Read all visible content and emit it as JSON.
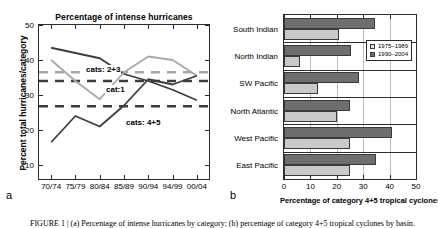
{
  "figure": {
    "panel_a_letter": "a",
    "panel_b_letter": "b",
    "caption": "FIGURE 1 | (a) Percentage of intense hurricanes by category; (b) percentage of category 4+5 tropical cyclones by basin."
  },
  "panel_a": {
    "title": "Percentage of intense hurricanes",
    "ylabel": "Percent total hurricanes/category",
    "letter": "a",
    "series_labels": {
      "cat1": "cat:1",
      "cat23": "cats: 2+3",
      "cat45": "cats: 4+5"
    }
  },
  "panel_b": {
    "xlabel": "Percentage of category 4+5 tropical cyclones",
    "letter": "b",
    "legend": [
      {
        "label": "1975–1989",
        "swatch": "old"
      },
      {
        "label": "1990–2004",
        "swatch": "new"
      }
    ]
  },
  "chart_data": [
    {
      "type": "line",
      "panel": "a",
      "title": "Percentage of intense hurricanes",
      "xlabel": "",
      "ylabel": "Percent total hurricanes/category",
      "categories": [
        "70/74",
        "75/79",
        "80/84",
        "85/89",
        "90/94",
        "94/99",
        "00/04"
      ],
      "xticklabels": [
        "70/74",
        "75/79",
        "80/84",
        "85/89",
        "90/94",
        "94/99",
        "00/04"
      ],
      "yticklabels": [
        "10",
        "20",
        "30",
        "40",
        "50"
      ],
      "yticks": [
        10,
        20,
        30,
        40,
        50
      ],
      "ylim": [
        6,
        50
      ],
      "grid": false,
      "legend_position": "inline-annotations",
      "series": [
        {
          "name": "cat:1",
          "label": "cat:1",
          "color": "#3d3d3d",
          "width": 1.8,
          "values": [
            43.5,
            42.0,
            40.5,
            36.0,
            34.0,
            31.5,
            28.5
          ]
        },
        {
          "name": "cats: 2+3",
          "label": "cats: 2+3",
          "color": "#a8a8a8",
          "width": 1.8,
          "values": [
            40.0,
            34.0,
            28.8,
            36.5,
            41.0,
            40.0,
            35.5
          ]
        },
        {
          "name": "cats: 4+5",
          "label": "cats: 4+5",
          "color": "#3d3d3d",
          "width": 1.8,
          "values": [
            16.5,
            24.0,
            21.0,
            27.0,
            34.5,
            33.0,
            35.5
          ]
        }
      ],
      "mean_lines": [
        {
          "name": "mean cats: 2+3",
          "value": 36.5,
          "color": "#a8a8a8",
          "style": "dashed"
        },
        {
          "name": "mean cat:1",
          "value": 34.0,
          "color": "#3d3d3d",
          "style": "dashed"
        },
        {
          "name": "mean cats: 4+5",
          "value": 26.8,
          "color": "#3d3d3d",
          "style": "dashed"
        }
      ]
    },
    {
      "type": "bar",
      "orientation": "horizontal",
      "panel": "b",
      "title": "",
      "xlabel": "Percentage of category 4+5 tropical cyclones",
      "ylabel": "",
      "categories": [
        "South Indian",
        "North Indian",
        "SW Pacific",
        "North Atlantic",
        "West Pacific",
        "East Pacific"
      ],
      "xticks": [
        0,
        10,
        20,
        30,
        40,
        50
      ],
      "xticklabels": [
        "0",
        "10",
        "20",
        "30",
        "40",
        "50"
      ],
      "xlim": [
        0,
        50
      ],
      "grid": true,
      "legend_position": "middle-right",
      "series": [
        {
          "name": "1975–1989",
          "color": "#c9c9c9",
          "values": [
            21.0,
            6.0,
            13.0,
            20.0,
            25.0,
            25.0
          ]
        },
        {
          "name": "1990–2004",
          "color": "#6e6e6e",
          "values": [
            34.5,
            25.5,
            28.5,
            25.0,
            41.0,
            35.0
          ]
        }
      ]
    }
  ]
}
